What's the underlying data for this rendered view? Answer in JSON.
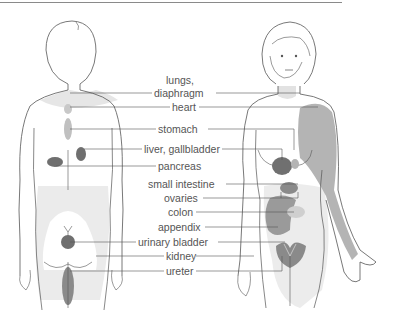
{
  "diagram": {
    "type": "referred-pain-map",
    "figures": [
      {
        "name": "back-view",
        "description": "Figure seen from the back"
      },
      {
        "name": "front-view",
        "description": "Female figure seen from the front"
      }
    ],
    "colors": {
      "outline": "#555555",
      "light_area": "#e6e6e6",
      "mid_area": "#b4b4b4",
      "dark_area": "#6f6f6f",
      "leader_line": "#555555",
      "label_text": "#555555"
    },
    "labels": [
      {
        "id": "lungs",
        "text": "lungs,"
      },
      {
        "id": "diaphragm",
        "text": "diaphragm"
      },
      {
        "id": "heart",
        "text": "heart"
      },
      {
        "id": "stomach",
        "text": "stomach"
      },
      {
        "id": "liver",
        "text": "liver, gallbladder"
      },
      {
        "id": "pancreas",
        "text": "pancreas"
      },
      {
        "id": "small_intestine",
        "text": "small intestine"
      },
      {
        "id": "ovaries",
        "text": "ovaries"
      },
      {
        "id": "colon",
        "text": "colon"
      },
      {
        "id": "appendix",
        "text": "appendix"
      },
      {
        "id": "urinary_bladder",
        "text": "urinary bladder"
      },
      {
        "id": "kidney",
        "text": "kidney"
      },
      {
        "id": "ureter",
        "text": "ureter"
      }
    ]
  }
}
